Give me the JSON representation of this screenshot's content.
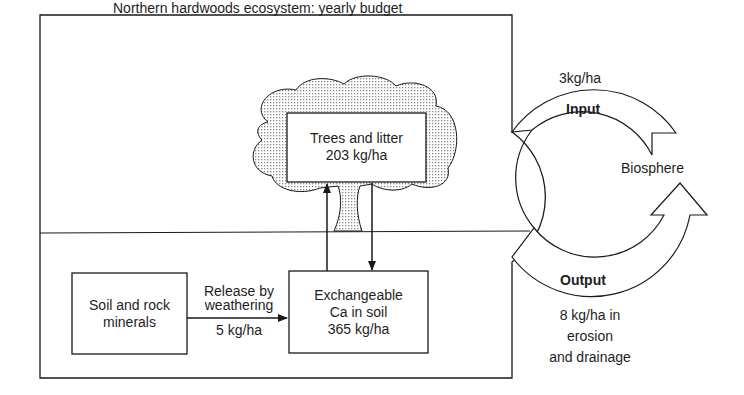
{
  "title": "Northern hardwoods ecosystem: yearly budget",
  "nodes": {
    "trees": {
      "line1": "Trees and litter",
      "line2": "203 kg/ha"
    },
    "soil_rock": {
      "line1": "Soil and rock",
      "line2": "minerals"
    },
    "exchangeable": {
      "line1": "Exchangeable",
      "line2": "Ca in soil",
      "line3": "365 kg/ha"
    },
    "biosphere": {
      "label": "Biosphere"
    }
  },
  "flows": {
    "weathering": {
      "line1": "Release by",
      "line2": "weathering",
      "value": "5 kg/ha"
    },
    "input": {
      "label": "Input",
      "value": "3kg/ha"
    },
    "output": {
      "label": "Output",
      "line1": "8 kg/ha in",
      "line2": "erosion",
      "line3": "and drainage"
    }
  },
  "colors": {
    "line": "#1a1a1a",
    "fill": "#ffffff",
    "stipple": "#9a9a9a"
  }
}
